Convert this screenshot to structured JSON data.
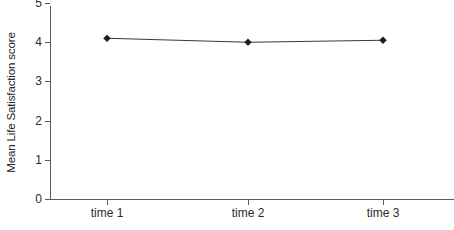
{
  "chart_data": {
    "type": "line",
    "title": "",
    "subtitle": "",
    "xlabel": "",
    "ylabel": "Mean Life Satisfaction score",
    "categories": [
      "time 1",
      "time 2",
      "time 3"
    ],
    "values": [
      4.1,
      4.0,
      4.05
    ],
    "series": [
      {
        "name": "Mean Life Satisfaction score",
        "values": [
          4.1,
          4.0,
          4.05
        ],
        "marker": "diamond",
        "color": "#2b2b2b"
      }
    ],
    "ylim": [
      0,
      5
    ],
    "yticks": [
      0,
      1,
      2,
      3,
      4,
      5
    ],
    "ytick_labels": [
      "0",
      "1",
      "2",
      "3",
      "4",
      "5"
    ],
    "xtick_labels": [
      "time 1",
      "time 2",
      "time 3"
    ],
    "grid": false,
    "legend": false,
    "legend_position": "none",
    "annotations": []
  },
  "style": {
    "background": "#ffffff",
    "axis_color": "#5a5a5a",
    "line_color": "#3a3a3a",
    "marker_color": "#1c1c1c",
    "text_color": "#2b2b2b"
  }
}
